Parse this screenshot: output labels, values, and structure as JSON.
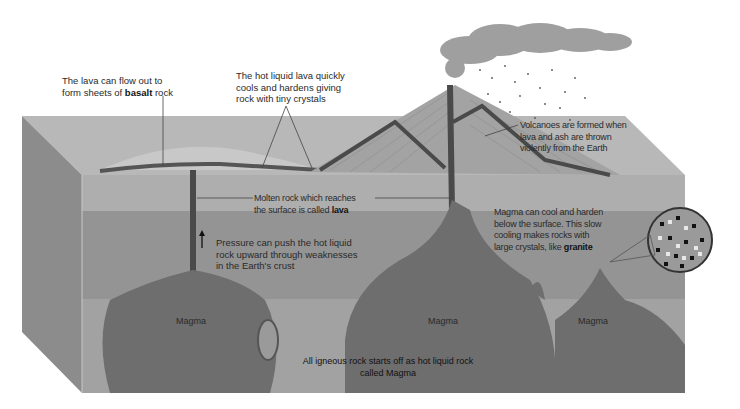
{
  "diagram": {
    "annotations": {
      "basalt": {
        "line1": "The lava can flow out to",
        "line2_pre": "form sheets of ",
        "line2_bold": "basalt",
        "line2_post": " rock"
      },
      "tiny_crystals": {
        "line1": "The hot liquid lava quickly",
        "line2": "cools and hardens giving",
        "line3": "rock with tiny crystals"
      },
      "volcanoes": {
        "line1": "Volcanoes are formed when",
        "line2": "lava and ash are thrown",
        "line3": "violently from the Earth"
      },
      "lava": {
        "line1": "Molten rock which reaches",
        "line2_pre": "the surface is called ",
        "line2_bold": "lava"
      },
      "pressure": {
        "line1": "Pressure can push the hot liquid",
        "line2": "rock upward through weaknesses",
        "line3": "in the Earth's crust"
      },
      "granite": {
        "line1": "Magma can cool and harden",
        "line2": "below the surface. This slow",
        "line3": "cooling makes rocks with",
        "line4_pre": "large crystals, like ",
        "line4_bold": "granite"
      },
      "igneous": {
        "line1": "All igneous rock starts off as hot liquid rock",
        "line2": "called Magma"
      }
    },
    "magma_labels": [
      "Magma",
      "Magma",
      "Magma"
    ],
    "colors": {
      "top_surface": "#b5b5b5",
      "front_layer1": "#ababab",
      "front_layer2": "#8f8f8f",
      "front_layer3": "#a0a0a0",
      "side_face": "#8a8a8a",
      "magma": "#6e6e6e",
      "lava_channel": "#4a4a4a",
      "volcano": "#9c9c9c",
      "smoke": "#8a8a8a"
    }
  }
}
